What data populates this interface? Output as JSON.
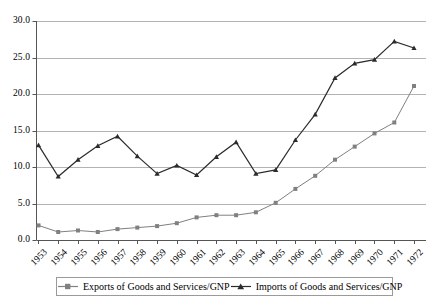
{
  "chart_data": {
    "type": "line",
    "title": "",
    "subtitle": "",
    "xlabel": "",
    "ylabel": "",
    "xlim": [
      "1953",
      "1972"
    ],
    "ylim": [
      0.0,
      30.0
    ],
    "ytick_labels": [
      "30.0",
      "25.0",
      "20.0",
      "15.0",
      "10.0",
      "5.0",
      "0.0"
    ],
    "ytick_values": [
      30.0,
      25.0,
      20.0,
      15.0,
      10.0,
      5.0,
      0.0
    ],
    "grid": "horizontal",
    "legend_position": "bottom",
    "categories": [
      "1953",
      "1954",
      "1955",
      "1956",
      "1957",
      "1958",
      "1959",
      "1960",
      "1961",
      "1962",
      "1963",
      "1964",
      "1965",
      "1966",
      "1967",
      "1968",
      "1969",
      "1970",
      "1971",
      "1972"
    ],
    "series": [
      {
        "name": "Exports of Goods and Services/GNP",
        "marker": "square",
        "color": "#808080",
        "values": [
          2.0,
          1.1,
          1.3,
          1.1,
          1.5,
          1.7,
          1.9,
          2.3,
          3.1,
          3.4,
          3.4,
          3.8,
          5.1,
          7.0,
          8.8,
          11.0,
          12.8,
          14.6,
          16.1,
          21.1
        ]
      },
      {
        "name": "Imports of Goods and Services/GNP",
        "marker": "triangle",
        "color": "#2b2b2b",
        "values": [
          13.0,
          8.7,
          11.0,
          12.9,
          14.2,
          11.5,
          9.1,
          10.2,
          8.9,
          11.4,
          13.4,
          9.1,
          9.6,
          13.7,
          17.2,
          22.2,
          24.2,
          24.7,
          27.2,
          26.3
        ]
      }
    ]
  },
  "legend": {
    "entries": [
      {
        "label": "Exports of Goods and Services/GNP"
      },
      {
        "label": "Imports of Goods and Services/GNP"
      }
    ]
  },
  "colors": {
    "exports": "#808080",
    "imports": "#2b2b2b",
    "grid": "#b3b3b3",
    "axis": "#555555"
  }
}
